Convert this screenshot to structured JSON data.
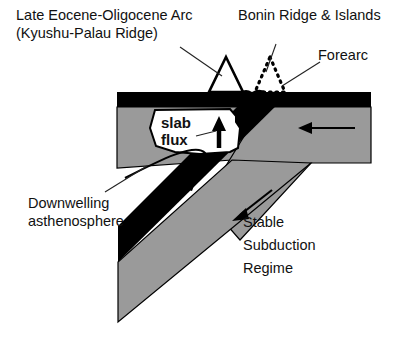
{
  "figure": {
    "colors": {
      "background": "#ffffff",
      "mantle_gray": "#9a9a9a",
      "lithosphere_black": "#000000",
      "text": "#111111",
      "leader_line": "#222222"
    }
  },
  "labels": {
    "arc_line1": "Late Eocene-Oligocene Arc",
    "arc_line2": "(Kyushu-Palau Ridge)",
    "bonin": "Bonin Ridge & Islands",
    "forearc": "Forearc",
    "slab_flux_line1": "slab",
    "slab_flux_line2": "flux",
    "downwelling_line1": "Downwelling",
    "downwelling_line2": "asthenosphere",
    "regime_line1": "Stable",
    "regime_line2": "Subduction",
    "regime_line3": "Regime"
  },
  "features": {
    "arc_volcano": "solid-triangle-arc-volcano",
    "bonin_ridge": "dotted-triangle-bonin-ridge",
    "upper_plate_crust": "black-crust-band",
    "mantle_wedge": "gray-mantle-wedge",
    "subducting_slab": "black-diagonal-slab",
    "overriding_plate": "gray-overriding-plate",
    "arrow_convergence": "left-pointing-arrow",
    "arrow_slab_descent": "down-left-slab-arrow",
    "arrow_slab_flux": "up-arrow-slab-flux",
    "arrow_downwelling": "curved-down-left-arrow"
  }
}
